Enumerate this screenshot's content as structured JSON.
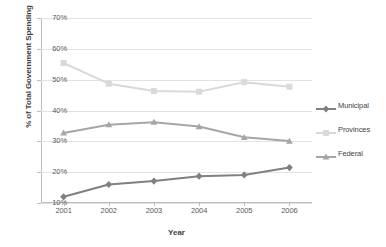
{
  "chart_data": {
    "type": "line",
    "title": "",
    "xlabel": "Year",
    "ylabel": "% of Total Government Spending",
    "categories": [
      "2001",
      "2002",
      "2003",
      "2004",
      "2005",
      "2006"
    ],
    "ylim": [
      10,
      70
    ],
    "ytick_labels": [
      "10%",
      "20%",
      "30%",
      "40%",
      "50%",
      "60%",
      "70%"
    ],
    "ytick_values": [
      10,
      20,
      30,
      40,
      50,
      60,
      70
    ],
    "grid": true,
    "legend_position": "right",
    "series": [
      {
        "name": "Municipal",
        "color": "#808080",
        "marker": "diamond",
        "values": [
          12.0,
          16.0,
          17.1,
          18.7,
          19.1,
          21.5
        ]
      },
      {
        "name": "Provinces",
        "color": "#d9d9d9",
        "marker": "square",
        "values": [
          55.4,
          48.7,
          46.3,
          46.1,
          49.2,
          47.7
        ]
      },
      {
        "name": "Federal",
        "color": "#a6a6a6",
        "marker": "triangle",
        "values": [
          32.7,
          35.4,
          36.2,
          34.8,
          31.3,
          30.1
        ]
      }
    ]
  }
}
